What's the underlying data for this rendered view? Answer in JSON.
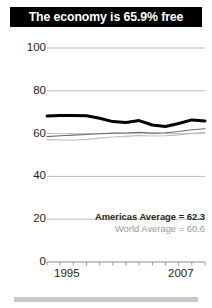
{
  "title": {
    "text": "The economy is 65.9% free"
  },
  "colors": {
    "banner_bg": "#000000",
    "banner_text": "#ffffff",
    "country_line": "#000000",
    "americas_line": "#6e6e6e",
    "world_line": "#bdbdbd",
    "gridline": "#b5b5b5",
    "axis_text": "#231f20",
    "legend_world_text": "#9a9a9a",
    "bottom_bar": "#c9c9c9"
  },
  "legend": {
    "americas": "Americas Average = 62.3",
    "world": "World Average = 60.6"
  },
  "axis": {
    "x_start_label": "1995",
    "x_end_label": "2007",
    "y_labels": [
      "100",
      "80",
      "60",
      "40",
      "20",
      "0"
    ]
  },
  "chart_data": {
    "type": "line",
    "title": "The economy is 65.9% free",
    "xlabel": "",
    "ylabel": "",
    "xlim": [
      1995,
      2007
    ],
    "ylim": [
      0,
      100
    ],
    "grid": true,
    "legend_position": "inside-right",
    "x": [
      1995,
      1996,
      1997,
      1998,
      1999,
      2000,
      2001,
      2002,
      2003,
      2004,
      2005,
      2006,
      2007
    ],
    "yticks": [
      0,
      20,
      40,
      60,
      80,
      100
    ],
    "xticks": [
      1995,
      1996,
      1997,
      1998,
      1999,
      2000,
      2001,
      2002,
      2003,
      2004,
      2005,
      2006,
      2007
    ],
    "series": [
      {
        "name": "Country",
        "color": "#000000",
        "width": 3.0,
        "final_value": 65.9,
        "values": [
          68.2,
          68.4,
          68.5,
          68.3,
          67.2,
          65.6,
          65.2,
          66.1,
          64.0,
          63.3,
          64.7,
          66.4,
          65.9
        ]
      },
      {
        "name": "Americas Average",
        "color": "#6e6e6e",
        "width": 1.1,
        "final_value": 62.3,
        "values": [
          58.6,
          59.0,
          59.3,
          59.6,
          59.9,
          60.2,
          60.3,
          60.6,
          60.2,
          60.4,
          61.0,
          61.8,
          62.3
        ]
      },
      {
        "name": "World Average",
        "color": "#bdbdbd",
        "width": 1.1,
        "final_value": 60.6,
        "values": [
          57.2,
          57.0,
          56.9,
          57.3,
          57.9,
          58.4,
          58.7,
          59.1,
          58.9,
          59.0,
          59.4,
          60.1,
          60.6
        ]
      }
    ]
  }
}
